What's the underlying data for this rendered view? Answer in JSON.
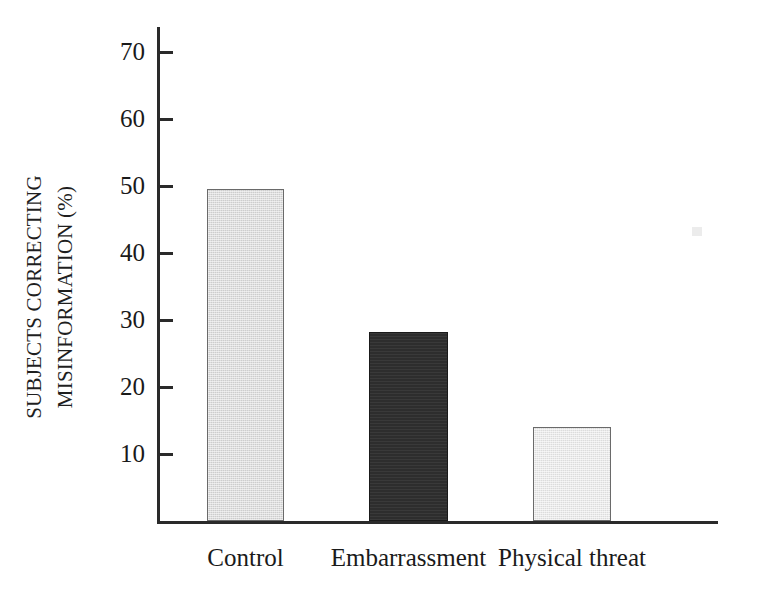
{
  "chart_data": {
    "type": "bar",
    "title": "",
    "subtitle": "",
    "xlabel": "",
    "ylabel_line1": "SUBJECTS CORRECTING",
    "ylabel_line2": "MISINFORMATION (%)",
    "ylabel": "SUBJECTS CORRECTING MISINFORMATION (%)",
    "categories": [
      "Control",
      "Embarrassment",
      "Physical threat"
    ],
    "values": [
      49.5,
      28.2,
      14.1
    ],
    "bar_fills": [
      "light-gray-halftone",
      "near-black",
      "pale-gray-halftone"
    ],
    "bar_colors": [
      "#cdcdcd",
      "#2d2d2d",
      "#dcdcdc"
    ],
    "bar_border_color": "#6a6a6a",
    "axis_color": "#2a2a2a",
    "ylim": [
      0,
      75
    ],
    "ytick_values": [
      10,
      20,
      30,
      40,
      50,
      60,
      70
    ],
    "ytick_labels": [
      "10",
      "20",
      "30",
      "40",
      "50",
      "60",
      "70"
    ],
    "grid": false,
    "legend": false,
    "legend_position": "none"
  },
  "figure": {
    "background_color": "#ffffff",
    "artifact_label": "scan-speck"
  }
}
